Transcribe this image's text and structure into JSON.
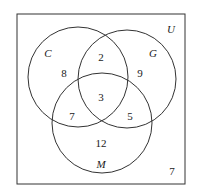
{
  "diagram": {
    "type": "venn",
    "universe_label": "U",
    "sets": [
      {
        "label": "C"
      },
      {
        "label": "G"
      },
      {
        "label": "M"
      }
    ],
    "regions": {
      "C_only": "8",
      "G_only": "9",
      "M_only": "12",
      "C_and_G_only": "2",
      "C_and_M_only": "7",
      "G_and_M_only": "5",
      "C_and_G_and_M": "3",
      "outside": "7"
    },
    "colors": {
      "stroke": "#333333",
      "background": "#ffffff"
    }
  }
}
